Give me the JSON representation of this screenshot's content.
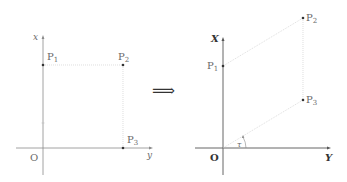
{
  "left_diagram": {
    "axis_vertical_label": "x",
    "axis_horizontal_label": "y",
    "origin_label": "O",
    "points": [
      {
        "name": "P",
        "sub": "1"
      },
      {
        "name": "P",
        "sub": "2"
      },
      {
        "name": "P",
        "sub": "3"
      }
    ]
  },
  "arrow": {
    "symbol": "⟹"
  },
  "right_diagram": {
    "axis_vertical_label": "X",
    "axis_horizontal_label": "Y",
    "origin_label": "O",
    "angle_label": "τ",
    "points": [
      {
        "name": "P",
        "sub": "1"
      },
      {
        "name": "P",
        "sub": "2"
      },
      {
        "name": "P",
        "sub": "3"
      }
    ]
  },
  "colors": {
    "axis": "#8a8a8a",
    "axis_dark": "#555555",
    "dotted": "#c8c8c8",
    "point": "#333333"
  }
}
